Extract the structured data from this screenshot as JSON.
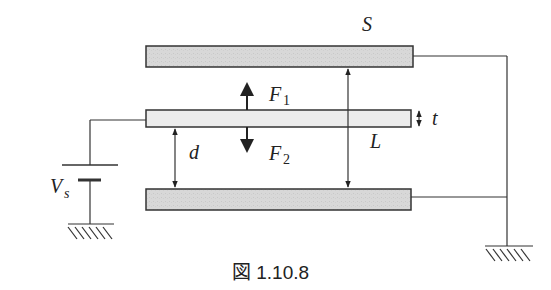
{
  "diagram": {
    "caption": "図 1.10.8",
    "labels": {
      "S": "S",
      "F1": "F",
      "F1_sub": "1",
      "F2": "F",
      "F2_sub": "2",
      "d": "d",
      "L": "L",
      "t": "t",
      "Vs": "V",
      "Vs_sub": "s"
    },
    "components": [
      {
        "id": "top-plate",
        "type": "electrode",
        "fill": "#d6d6d6"
      },
      {
        "id": "middle-plate",
        "type": "movable-plate",
        "fill": "#ececec"
      },
      {
        "id": "bottom-plate",
        "type": "electrode",
        "fill": "#d6d6d6"
      },
      {
        "id": "voltage-source",
        "type": "battery",
        "label": "Vs"
      },
      {
        "id": "ground-left",
        "type": "ground"
      },
      {
        "id": "ground-right",
        "type": "ground"
      }
    ],
    "colors": {
      "stroke": "#333333",
      "plate_fill": "#d6d6d6",
      "middle_fill": "#ececec"
    }
  }
}
